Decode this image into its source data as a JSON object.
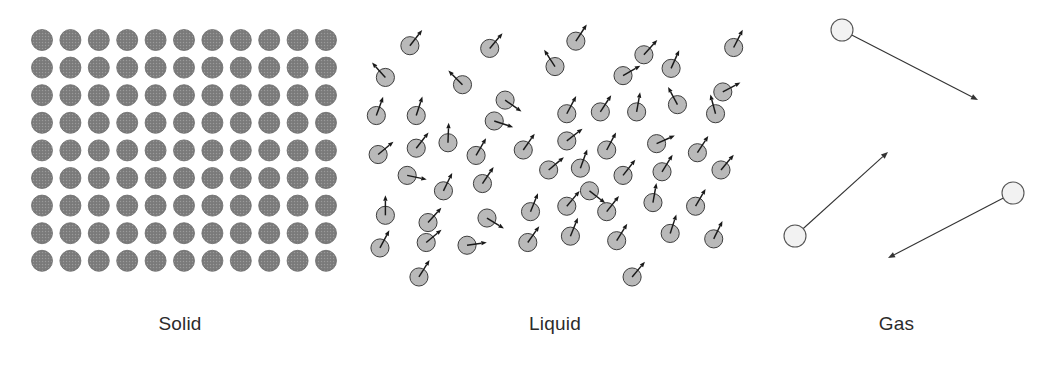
{
  "figure": {
    "background_color": "#ffffff",
    "width": 1043,
    "height": 372
  },
  "panels": [
    {
      "id": "solid",
      "label": "Solid",
      "description": "Particles packed in a regular, fixed lattice; no motion arrows.",
      "particle": {
        "style": "filled-gray-disc",
        "fill_color": "#7e7e7e",
        "stroke_color": "#6a6a6a",
        "diameter": 21
      },
      "lattice": {
        "columns": 11,
        "rows": 9,
        "x_start": 42,
        "y_start": 40,
        "x_spacing": 28.4,
        "y_spacing": 27.6
      },
      "motion_arrows": false
    },
    {
      "id": "liquid",
      "label": "Liquid",
      "description": "Particles close together but disordered, each with a short motion arrow.",
      "particle": {
        "style": "outlined-light-gray-disc",
        "fill_color": "#b9b9b9",
        "stroke_color": "#3c3c3c",
        "diameter": 20
      },
      "arrow": {
        "color": "#1a1a1a",
        "length": 22,
        "head_size": 6,
        "line_width": 1.6
      },
      "motion_arrows": true,
      "particle_count": 56,
      "particles": [
        {
          "x": 55,
          "y": 45,
          "angle": -52
        },
        {
          "x": 143,
          "y": 48,
          "angle": -50
        },
        {
          "x": 238,
          "y": 40,
          "angle": -57
        },
        {
          "x": 313,
          "y": 55,
          "angle": -48
        },
        {
          "x": 412,
          "y": 47,
          "angle": -63
        },
        {
          "x": 28,
          "y": 80,
          "angle": -132
        },
        {
          "x": 113,
          "y": 88,
          "angle": -135
        },
        {
          "x": 215,
          "y": 68,
          "angle": -123
        },
        {
          "x": 290,
          "y": 78,
          "angle": -30
        },
        {
          "x": 343,
          "y": 70,
          "angle": -66
        },
        {
          "x": 400,
          "y": 96,
          "angle": -28
        },
        {
          "x": 18,
          "y": 122,
          "angle": -70
        },
        {
          "x": 62,
          "y": 122,
          "angle": -72
        },
        {
          "x": 148,
          "y": 128,
          "angle": 18
        },
        {
          "x": 228,
          "y": 120,
          "angle": -62
        },
        {
          "x": 265,
          "y": 118,
          "angle": -57
        },
        {
          "x": 305,
          "y": 118,
          "angle": -80
        },
        {
          "x": 392,
          "y": 120,
          "angle": -105
        },
        {
          "x": 20,
          "y": 165,
          "angle": -40
        },
        {
          "x": 62,
          "y": 158,
          "angle": -52
        },
        {
          "x": 97,
          "y": 152,
          "angle": -88
        },
        {
          "x": 128,
          "y": 166,
          "angle": -60
        },
        {
          "x": 180,
          "y": 160,
          "angle": -55
        },
        {
          "x": 228,
          "y": 150,
          "angle": -38
        },
        {
          "x": 272,
          "y": 160,
          "angle": -62
        },
        {
          "x": 327,
          "y": 153,
          "angle": -24
        },
        {
          "x": 372,
          "y": 163,
          "angle": -57
        },
        {
          "x": 52,
          "y": 188,
          "angle": 12
        },
        {
          "x": 92,
          "y": 205,
          "angle": -64
        },
        {
          "x": 135,
          "y": 197,
          "angle": -56
        },
        {
          "x": 208,
          "y": 182,
          "angle": -40
        },
        {
          "x": 243,
          "y": 180,
          "angle": -70
        },
        {
          "x": 290,
          "y": 188,
          "angle": -52
        },
        {
          "x": 333,
          "y": 184,
          "angle": -58
        },
        {
          "x": 398,
          "y": 182,
          "angle": -50
        },
        {
          "x": 28,
          "y": 232,
          "angle": -90
        },
        {
          "x": 75,
          "y": 240,
          "angle": -48
        },
        {
          "x": 140,
          "y": 235,
          "angle": 32
        },
        {
          "x": 188,
          "y": 228,
          "angle": -68
        },
        {
          "x": 228,
          "y": 222,
          "angle": -50
        },
        {
          "x": 272,
          "y": 228,
          "angle": -52
        },
        {
          "x": 323,
          "y": 218,
          "angle": -80
        },
        {
          "x": 370,
          "y": 222,
          "angle": -60
        },
        {
          "x": 22,
          "y": 268,
          "angle": -62
        },
        {
          "x": 73,
          "y": 262,
          "angle": -40
        },
        {
          "x": 118,
          "y": 265,
          "angle": -8
        },
        {
          "x": 185,
          "y": 262,
          "angle": -55
        },
        {
          "x": 232,
          "y": 255,
          "angle": -68
        },
        {
          "x": 283,
          "y": 260,
          "angle": -58
        },
        {
          "x": 342,
          "y": 252,
          "angle": -72
        },
        {
          "x": 390,
          "y": 258,
          "angle": -64
        },
        {
          "x": 160,
          "y": 105,
          "angle": 35
        },
        {
          "x": 253,
          "y": 205,
          "angle": 38
        },
        {
          "x": 350,
          "y": 110,
          "angle": -118
        },
        {
          "x": 65,
          "y": 300,
          "angle": -58
        },
        {
          "x": 300,
          "y": 300,
          "angle": -50
        }
      ]
    },
    {
      "id": "gas",
      "label": "Gas",
      "description": "Few particles far apart, each travelling along a long trajectory arrow.",
      "particle": {
        "style": "outlined-white-disc",
        "fill_color": "#f2f2f2",
        "stroke_color": "#555555",
        "diameter": 22
      },
      "arrow": {
        "color": "#333333",
        "head_size": 7,
        "line_width": 1.1
      },
      "motion_arrows": true,
      "particle_count": 3,
      "particles": [
        {
          "x": 92,
          "y": 30,
          "arrow_to_x": 228,
          "arrow_to_y": 100
        },
        {
          "x": 45,
          "y": 236,
          "arrow_to_x": 138,
          "arrow_to_y": 152
        },
        {
          "x": 263,
          "y": 193,
          "arrow_to_x": 138,
          "arrow_to_y": 258
        }
      ]
    }
  ]
}
